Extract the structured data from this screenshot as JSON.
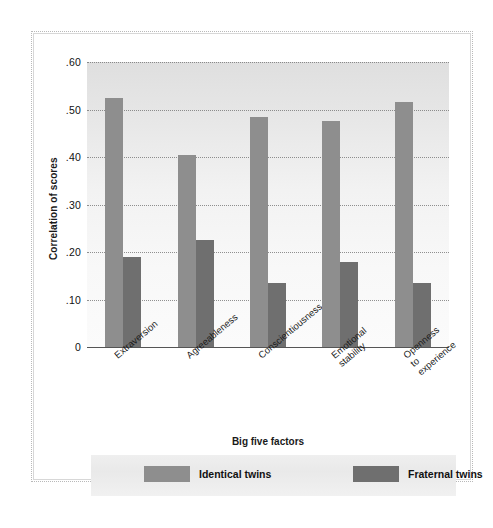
{
  "chart_data": {
    "type": "bar",
    "title": "",
    "xlabel": "Big five factors",
    "ylabel": "Correlation of scores",
    "categories": [
      "Extraversion",
      "Agreeableness",
      "Conscientiousness",
      "Emotional\nstability",
      "Openness\nto\nexperience"
    ],
    "series": [
      {
        "name": "Identical twins",
        "color": "#8e8e8e",
        "values": [
          0.525,
          0.405,
          0.485,
          0.475,
          0.515
        ]
      },
      {
        "name": "Fraternal twins",
        "color": "#6f6f6f",
        "values": [
          0.19,
          0.225,
          0.135,
          0.18,
          0.135
        ]
      }
    ],
    "ylim": [
      0,
      0.6
    ],
    "yticks": [
      0,
      0.1,
      0.2,
      0.3,
      0.4,
      0.5,
      0.6
    ],
    "ytick_labels": [
      "0",
      ".10",
      ".20",
      ".30",
      ".40",
      ".50",
      ".60"
    ],
    "grid": true,
    "legend_position": "bottom"
  },
  "legend": {
    "items": [
      {
        "label": "Identical twins",
        "color": "#8e8e8e"
      },
      {
        "label": "Fraternal twins",
        "color": "#6f6f6f"
      }
    ]
  },
  "axes": {
    "y_title": "Correlation of scores",
    "x_title": "Big five factors"
  }
}
